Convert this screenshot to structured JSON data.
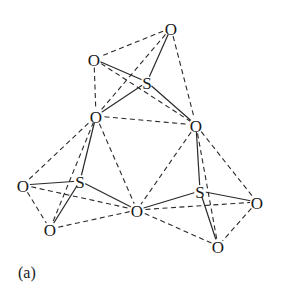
{
  "figure": {
    "caption": "(a)",
    "atoms": [
      {
        "id": "O1",
        "label": "O",
        "x": 171,
        "y": 28
      },
      {
        "id": "O2",
        "label": "O",
        "x": 94,
        "y": 59
      },
      {
        "id": "S1",
        "label": "S",
        "x": 147,
        "y": 82
      },
      {
        "id": "O3",
        "label": "O",
        "x": 96,
        "y": 116
      },
      {
        "id": "O4",
        "label": "O",
        "x": 196,
        "y": 125
      },
      {
        "id": "O5",
        "label": "O",
        "x": 23,
        "y": 185
      },
      {
        "id": "S2",
        "label": "S",
        "x": 80,
        "y": 181
      },
      {
        "id": "O6",
        "label": "O",
        "x": 50,
        "y": 229
      },
      {
        "id": "O7",
        "label": "O",
        "x": 137,
        "y": 210
      },
      {
        "id": "S3",
        "label": "S",
        "x": 200,
        "y": 191
      },
      {
        "id": "O8",
        "label": "O",
        "x": 257,
        "y": 202
      },
      {
        "id": "O9",
        "label": "O",
        "x": 218,
        "y": 246
      }
    ],
    "solid_bonds": [
      [
        "S1",
        "O1"
      ],
      [
        "S1",
        "O2"
      ],
      [
        "S1",
        "O3"
      ],
      [
        "S1",
        "O4"
      ],
      [
        "S2",
        "O5"
      ],
      [
        "S2",
        "O3"
      ],
      [
        "S2",
        "O6"
      ],
      [
        "S2",
        "O7"
      ],
      [
        "S3",
        "O4"
      ],
      [
        "S3",
        "O7"
      ],
      [
        "S3",
        "O8"
      ],
      [
        "S3",
        "O9"
      ]
    ],
    "dashed_edges": [
      [
        "O1",
        "O2"
      ],
      [
        "O1",
        "O3"
      ],
      [
        "O1",
        "O4"
      ],
      [
        "O2",
        "O3"
      ],
      [
        "O2",
        "O4"
      ],
      [
        "O3",
        "O4"
      ],
      [
        "O5",
        "O3"
      ],
      [
        "O5",
        "O6"
      ],
      [
        "O5",
        "O7"
      ],
      [
        "O6",
        "O3"
      ],
      [
        "O6",
        "O7"
      ],
      [
        "O3",
        "O7"
      ],
      [
        "O4",
        "O7"
      ],
      [
        "O4",
        "O8"
      ],
      [
        "O4",
        "O9"
      ],
      [
        "O7",
        "O8"
      ],
      [
        "O7",
        "O9"
      ],
      [
        "O8",
        "O9"
      ]
    ]
  }
}
